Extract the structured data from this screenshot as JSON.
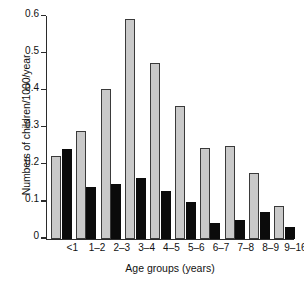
{
  "chart_data": {
    "type": "bar",
    "title": "",
    "xlabel": "Age groups (years)",
    "ylabel": "Numbers of children/1000/year",
    "categories": [
      "<1",
      "1–2",
      "2–3",
      "3–4",
      "4–5",
      "5–6",
      "6–7",
      "7–8",
      "8–9",
      "9–16"
    ],
    "series": [
      {
        "name": "grey-series",
        "color": "#c9c9c9",
        "values": [
          0.222,
          0.29,
          0.403,
          0.592,
          0.473,
          0.358,
          0.245,
          0.249,
          0.178,
          0.089
        ]
      },
      {
        "name": "black-series",
        "color": "#0b0b0b",
        "values": [
          0.242,
          0.138,
          0.147,
          0.164,
          0.129,
          0.099,
          0.042,
          0.05,
          0.073,
          0.031
        ]
      }
    ],
    "ylim": [
      0,
      0.6
    ],
    "yticks": [
      0,
      0.1,
      0.2,
      0.3,
      0.4,
      0.5,
      0.6
    ],
    "ytick_labels": [
      "0",
      "0.1",
      "0.2",
      "0.3",
      "0.4",
      "0.5",
      "0.6"
    ],
    "grid": false,
    "legend": "none"
  }
}
